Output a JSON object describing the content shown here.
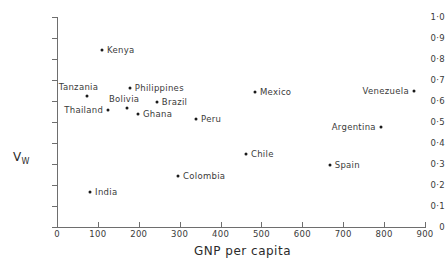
{
  "chart_data": {
    "type": "scatter",
    "title": "",
    "xlabel": "GNP per capita",
    "ylabel": "V_W",
    "ylabel_base": "V",
    "ylabel_sub": "W",
    "xlim": [
      0,
      900
    ],
    "ylim": [
      0,
      1.0
    ],
    "grid": false,
    "legend": "none",
    "xticks": [
      0,
      100,
      200,
      300,
      400,
      500,
      600,
      700,
      800,
      900
    ],
    "xtick_labels": [
      "0",
      "100",
      "200",
      "300",
      "400",
      "500",
      "600",
      "700",
      "800",
      "900"
    ],
    "yticks": [
      0,
      0.1,
      0.2,
      0.3,
      0.4,
      0.5,
      0.6,
      0.7,
      0.8,
      0.9,
      1.0
    ],
    "ytick_labels": [
      "0",
      "0·1",
      "0·2",
      "0·3",
      "0·4",
      "0·5",
      "0·6",
      "0·7",
      "0·8",
      "0·9",
      "1·0"
    ],
    "points": [
      {
        "label": "Kenya",
        "x": 110,
        "y": 0.845,
        "label_side": "right"
      },
      {
        "label": "Tanzania",
        "x": 73,
        "y": 0.625,
        "label_side": "above-left"
      },
      {
        "label": "Thailand",
        "x": 125,
        "y": 0.555,
        "label_side": "left"
      },
      {
        "label": "Bolivia",
        "x": 171,
        "y": 0.565,
        "label_side": "above"
      },
      {
        "label": "Philippines",
        "x": 178,
        "y": 0.66,
        "label_side": "right"
      },
      {
        "label": "Brazil",
        "x": 244,
        "y": 0.597,
        "label_side": "right"
      },
      {
        "label": "Ghana",
        "x": 198,
        "y": 0.54,
        "label_side": "right"
      },
      {
        "label": "Peru",
        "x": 340,
        "y": 0.512,
        "label_side": "right"
      },
      {
        "label": "Mexico",
        "x": 484,
        "y": 0.645,
        "label_side": "right"
      },
      {
        "label": "Venezuela",
        "x": 873,
        "y": 0.65,
        "label_side": "left"
      },
      {
        "label": "Argentina",
        "x": 792,
        "y": 0.475,
        "label_side": "left"
      },
      {
        "label": "Chile",
        "x": 462,
        "y": 0.35,
        "label_side": "right"
      },
      {
        "label": "Spain",
        "x": 667,
        "y": 0.293,
        "label_side": "right"
      },
      {
        "label": "Colombia",
        "x": 296,
        "y": 0.242,
        "label_side": "right"
      },
      {
        "label": "India",
        "x": 81,
        "y": 0.165,
        "label_side": "right"
      }
    ]
  }
}
